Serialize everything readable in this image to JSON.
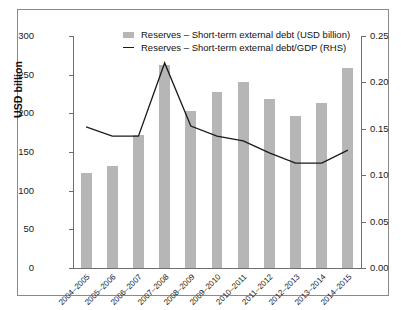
{
  "chart_data": {
    "type": "bar",
    "title": "",
    "subtitle": "",
    "xlabel": "",
    "ylabel": "USD billion",
    "y2label": "",
    "ylim": [
      0,
      300
    ],
    "y2lim": [
      0,
      0.25
    ],
    "yticks": [
      "0",
      "50",
      "100",
      "150",
      "200",
      "250",
      "300"
    ],
    "ytick_values": [
      0,
      50,
      100,
      150,
      200,
      250,
      300
    ],
    "y2ticks": [
      "0.00",
      "0.05",
      "0.10",
      "0.15",
      "0.20",
      "0.25"
    ],
    "y2tick_values": [
      0.0,
      0.05,
      0.1,
      0.15,
      0.2,
      0.25
    ],
    "grid": false,
    "legend_position": "top-inside",
    "categories": [
      "2004–2005",
      "2005–2006",
      "2006–2007",
      "2007–2008",
      "2008–2009",
      "2009–2010",
      "2010–2011",
      "2011–2012",
      "2012–2013",
      "2013–2014",
      "2014–2015"
    ],
    "series": [
      {
        "name": "Reserves – Short-term external debt (USD billion)",
        "type": "bar",
        "axis": "left",
        "color": "#b6b6b6",
        "values": [
          123,
          132,
          172,
          262,
          203,
          228,
          241,
          218,
          197,
          214,
          258
        ]
      },
      {
        "name": "Reserves – Short-term external debt/GDP (RHS)",
        "type": "line",
        "axis": "right",
        "color": "#1a1a1a",
        "values": [
          0.152,
          0.142,
          0.142,
          0.221,
          0.153,
          0.142,
          0.137,
          0.124,
          0.113,
          0.113,
          0.127
        ]
      }
    ]
  },
  "legend": {
    "items": [
      {
        "marker": "swatch",
        "label": "Reserves – Short-term external debt (USD billion)"
      },
      {
        "marker": "line",
        "label": "Reserves – Short-term external debt/GDP (RHS)"
      }
    ]
  }
}
